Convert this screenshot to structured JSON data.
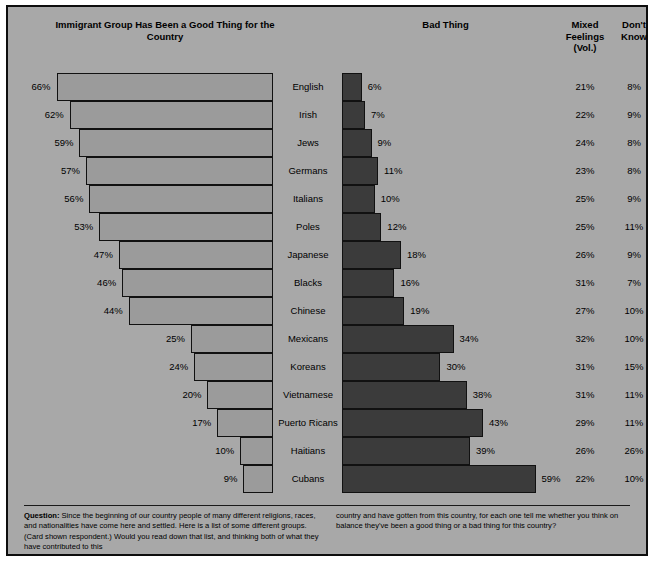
{
  "headers": {
    "good": "Immigrant Group Has Been a Good Thing for the Country",
    "bad": "Bad Thing",
    "mixed": "Mixed Feelings (Vol.)",
    "dont_know": "Don't Know"
  },
  "footnote": {
    "label": "Question:",
    "col1": " Since the beginning of our country people of many different religions, races, and nationalities have come here and settled. Here is a list of some different groups. (Card shown respondent.) Would you read down that list, and thinking both of what they have contributed to this",
    "col2": "country and have gotten from this country, for each one tell me whether you think on balance they've been a good thing or a bad thing for this country?"
  },
  "colors": {
    "background": "#a8a8a8",
    "good_bar": "#9b9b9b",
    "bad_bar": "#3b3b3b",
    "border": "#111111",
    "text": "#000000"
  },
  "chart_data": {
    "type": "bar",
    "title": "Immigrant Group Has Been a Good Thing for the Country",
    "orientation": "horizontal-diverging",
    "xlabel": "",
    "ylabel": "",
    "xlim": [
      0,
      70
    ],
    "grid": false,
    "legend_position": "top",
    "categories": [
      "English",
      "Irish",
      "Jews",
      "Germans",
      "Italians",
      "Poles",
      "Japanese",
      "Blacks",
      "Chinese",
      "Mexicans",
      "Koreans",
      "Vietnamese",
      "Puerto Ricans",
      "Haitians",
      "Cubans"
    ],
    "series": [
      {
        "name": "Immigrant Group Has Been a Good Thing for the Country",
        "values": [
          66,
          62,
          59,
          57,
          56,
          53,
          47,
          46,
          44,
          25,
          24,
          20,
          17,
          10,
          9
        ],
        "labels": [
          "66%",
          "62%",
          "59%",
          "57%",
          "56%",
          "53%",
          "47%",
          "46%",
          "44%",
          "25%",
          "24%",
          "20%",
          "17%",
          "10%",
          "9%"
        ]
      },
      {
        "name": "Bad Thing",
        "values": [
          6,
          7,
          9,
          11,
          10,
          12,
          18,
          16,
          19,
          34,
          30,
          38,
          43,
          39,
          59
        ],
        "labels": [
          "6%",
          "7%",
          "9%",
          "11%",
          "10%",
          "12%",
          "18%",
          "16%",
          "19%",
          "34%",
          "30%",
          "38%",
          "43%",
          "39%",
          "59%"
        ]
      },
      {
        "name": "Mixed Feelings (Vol.)",
        "values": [
          21,
          22,
          24,
          23,
          25,
          25,
          26,
          31,
          27,
          32,
          31,
          31,
          29,
          26,
          22
        ],
        "labels": [
          "21%",
          "22%",
          "24%",
          "23%",
          "25%",
          "25%",
          "26%",
          "31%",
          "27%",
          "32%",
          "31%",
          "31%",
          "29%",
          "26%",
          "22%"
        ]
      },
      {
        "name": "Don't Know",
        "values": [
          8,
          9,
          8,
          8,
          9,
          11,
          9,
          7,
          10,
          10,
          15,
          11,
          11,
          26,
          10
        ],
        "labels": [
          "8%",
          "9%",
          "8%",
          "8%",
          "9%",
          "11%",
          "9%",
          "7%",
          "10%",
          "10%",
          "15%",
          "11%",
          "11%",
          "26%",
          "10%"
        ]
      }
    ]
  }
}
